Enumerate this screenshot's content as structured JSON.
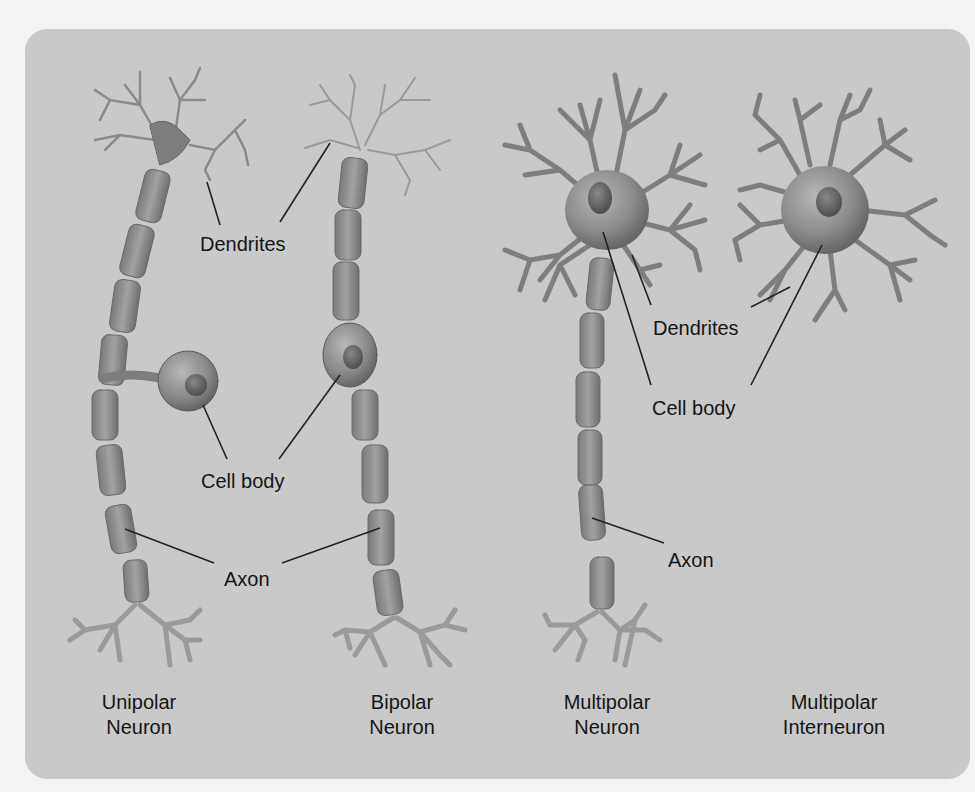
{
  "diagram": {
    "background_color": "#c9c9c9",
    "page_color": "#f4f4f4",
    "neuron_fill": "#8f8f8f",
    "neuron_dark": "#5e5e5e",
    "text_color": "#151515"
  },
  "labels": {
    "dendrites_left": "Dendrites",
    "cell_body_left": "Cell body",
    "axon_left": "Axon",
    "dendrites_right": "Dendrites",
    "cell_body_right": "Cell body",
    "axon_right": "Axon"
  },
  "neurons": [
    {
      "id": "unipolar",
      "caption_line1": "Unipolar",
      "caption_line2": "Neuron"
    },
    {
      "id": "bipolar",
      "caption_line1": "Bipolar",
      "caption_line2": "Neuron"
    },
    {
      "id": "multipolar",
      "caption_line1": "Multipolar",
      "caption_line2": "Neuron"
    },
    {
      "id": "interneuron",
      "caption_line1": "Multipolar",
      "caption_line2": "Interneuron"
    }
  ]
}
